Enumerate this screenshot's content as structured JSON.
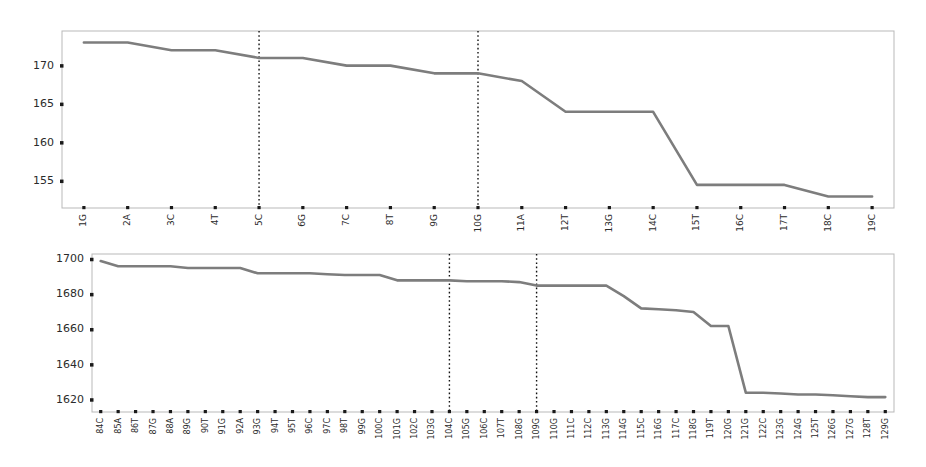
{
  "figure": {
    "background_color": "#ffffff",
    "line_color": "#7d7d7d",
    "frame_color": "#b9b9b9",
    "vline_color": "#111111",
    "panel_count": 2
  },
  "chart_data": [
    {
      "type": "line",
      "title": "",
      "xlabel": "",
      "ylabel": "",
      "grid": false,
      "legend": "none",
      "ylim": [
        151.5,
        174.5
      ],
      "yticks": [
        155,
        160,
        165,
        170
      ],
      "ytick_labels": [
        "155",
        "160",
        "165",
        "170"
      ],
      "categories": [
        "1G",
        "2A",
        "3C",
        "4T",
        "5C",
        "6G",
        "7C",
        "8T",
        "9G",
        "10G",
        "11A",
        "12T",
        "13G",
        "14C",
        "15T",
        "16C",
        "17T",
        "18C",
        "19C"
      ],
      "values": [
        173.0,
        173.0,
        172.0,
        172.0,
        171.0,
        171.0,
        170.0,
        170.0,
        169.0,
        169.0,
        168.0,
        164.0,
        164.0,
        164.0,
        154.5,
        154.5,
        154.5,
        153.0,
        153.0
      ],
      "annotations": [
        {
          "type": "vline",
          "label": "5C",
          "x_category": "5C",
          "style": "dotted"
        },
        {
          "type": "vline",
          "label": "10G",
          "x_category": "10G",
          "style": "dotted"
        }
      ]
    },
    {
      "type": "line",
      "title": "",
      "xlabel": "",
      "ylabel": "",
      "grid": false,
      "legend": "none",
      "ylim": [
        1613,
        1703
      ],
      "yticks": [
        1620,
        1640,
        1660,
        1680,
        1700
      ],
      "ytick_labels": [
        "1620",
        "1640",
        "1660",
        "1680",
        "1700"
      ],
      "categories": [
        "84C",
        "85A",
        "86T",
        "87G",
        "88A",
        "89G",
        "90T",
        "91G",
        "92A",
        "93G",
        "94T",
        "95T",
        "96C",
        "97C",
        "98T",
        "99G",
        "100C",
        "101G",
        "102C",
        "103G",
        "104C",
        "105G",
        "106C",
        "107T",
        "108G",
        "109G",
        "110G",
        "111C",
        "112C",
        "113G",
        "114G",
        "115C",
        "116G",
        "117C",
        "118G",
        "119T",
        "120G",
        "121G",
        "122C",
        "123G",
        "124G",
        "125T",
        "126G",
        "127G",
        "128T",
        "129G"
      ],
      "values": [
        1699.0,
        1696.0,
        1696.0,
        1696.0,
        1696.0,
        1695.0,
        1695.0,
        1695.0,
        1695.0,
        1692.0,
        1692.0,
        1692.0,
        1692.0,
        1691.5,
        1691.0,
        1691.0,
        1691.0,
        1688.0,
        1688.0,
        1688.0,
        1688.0,
        1687.5,
        1687.5,
        1687.5,
        1687.0,
        1685.0,
        1685.0,
        1685.0,
        1685.0,
        1685.0,
        1679.0,
        1672.0,
        1671.5,
        1671.0,
        1670.0,
        1662.0,
        1662.0,
        1624.0,
        1624.0,
        1623.5,
        1623.0,
        1623.0,
        1622.5,
        1622.0,
        1621.5,
        1621.5
      ],
      "annotations": [
        {
          "type": "vline",
          "label": "104C",
          "x_category": "104C",
          "style": "dotted"
        },
        {
          "type": "vline",
          "label": "109G",
          "x_category": "109G",
          "style": "dotted"
        }
      ]
    }
  ]
}
